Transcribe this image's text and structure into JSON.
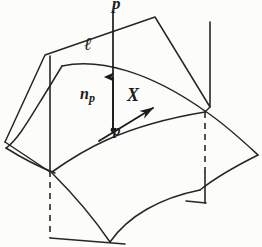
{
  "figure": {
    "background_color": "#fcfcfa",
    "ink_color": "#1b1b1b",
    "labels": {
      "line_top": "p",
      "normal_line": "ℓ",
      "normal_vector": "n",
      "normal_vector_subscript": "p",
      "tangent_vector": "X",
      "point": "p"
    },
    "elements": {
      "plane_name": "vertical cutting plane",
      "surface_name": "curved surface patch",
      "normal_line_name": "normal line l",
      "normal_arrow_name": "normal vector n_p",
      "tangent_arrow_name": "tangent vector X",
      "point_dot_name": "point p",
      "dashed_left_name": "left hidden vertical edge",
      "dashed_right_name": "right hidden vertical edge"
    },
    "geometry": {
      "plane_polygon": "5,142 45,55 155,17 210,107",
      "normal_line_x": 113,
      "normal_line_top_y": 12,
      "normal_line_bottom_y": 133,
      "normal_arrow_tip_y": 76,
      "point_p": [
        113,
        130
      ],
      "tangent_arrow_start": [
        100,
        140
      ],
      "tangent_arrow_end": [
        156,
        106
      ],
      "left_vertical_x": 50,
      "right_vertical_x": 205,
      "dash_pattern": "6 5"
    }
  }
}
